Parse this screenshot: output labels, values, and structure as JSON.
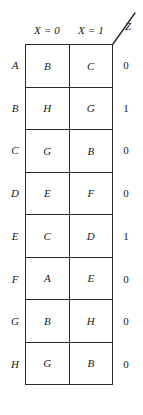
{
  "figure": {
    "type": "state-transition-table",
    "caption": "",
    "input_variable": "X",
    "output_variable": "Z",
    "output_pointer_label": "Z"
  },
  "headers": {
    "col0": {
      "var": "X",
      "eq": " = ",
      "bit": "0",
      "full": "X = 0"
    },
    "col1": {
      "var": "X",
      "eq": " = ",
      "bit": "1",
      "full": "X = 1"
    }
  },
  "rows": [
    {
      "state": "A",
      "x0": "B",
      "x1": "C",
      "z": "0"
    },
    {
      "state": "B",
      "x0": "H",
      "x1": "G",
      "z": "1"
    },
    {
      "state": "C",
      "x0": "G",
      "x1": "B",
      "z": "0"
    },
    {
      "state": "D",
      "x0": "E",
      "x1": "F",
      "z": "0"
    },
    {
      "state": "E",
      "x0": "C",
      "x1": "D",
      "z": "1"
    },
    {
      "state": "F",
      "x0": "A",
      "x1": "E",
      "z": "0"
    },
    {
      "state": "G",
      "x0": "B",
      "x1": "H",
      "z": "0"
    },
    {
      "state": "H",
      "x0": "G",
      "x1": "B",
      "z": "0"
    }
  ],
  "colors": {
    "background": "#ffffff",
    "ink": "#1a1a1a",
    "rule": "#2b2b2b"
  }
}
